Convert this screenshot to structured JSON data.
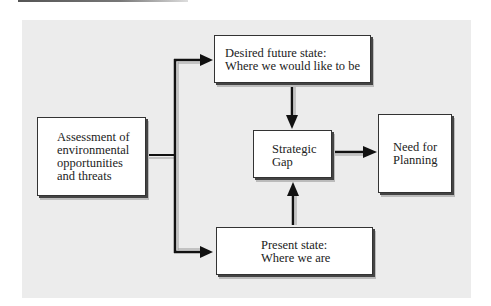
{
  "diagram": {
    "type": "flowchart",
    "nodes": [
      {
        "id": "assessment",
        "lines": [
          "Assessment of",
          "environmental",
          "opportunities",
          "and threats"
        ]
      },
      {
        "id": "desired",
        "lines": [
          "Desired future state:",
          "Where we would like to be"
        ]
      },
      {
        "id": "present",
        "lines": [
          "Present state:",
          "Where we are"
        ]
      },
      {
        "id": "gap",
        "lines": [
          "Strategic",
          "Gap"
        ]
      },
      {
        "id": "need",
        "lines": [
          "Need for",
          "Planning"
        ]
      }
    ],
    "edges": [
      {
        "from": "assessment",
        "to": "desired"
      },
      {
        "from": "assessment",
        "to": "present"
      },
      {
        "from": "desired",
        "to": "gap"
      },
      {
        "from": "present",
        "to": "gap"
      },
      {
        "from": "gap",
        "to": "need"
      }
    ],
    "colors": {
      "panel": "#ececec",
      "box": "#ffffff",
      "line": "#111111"
    }
  }
}
